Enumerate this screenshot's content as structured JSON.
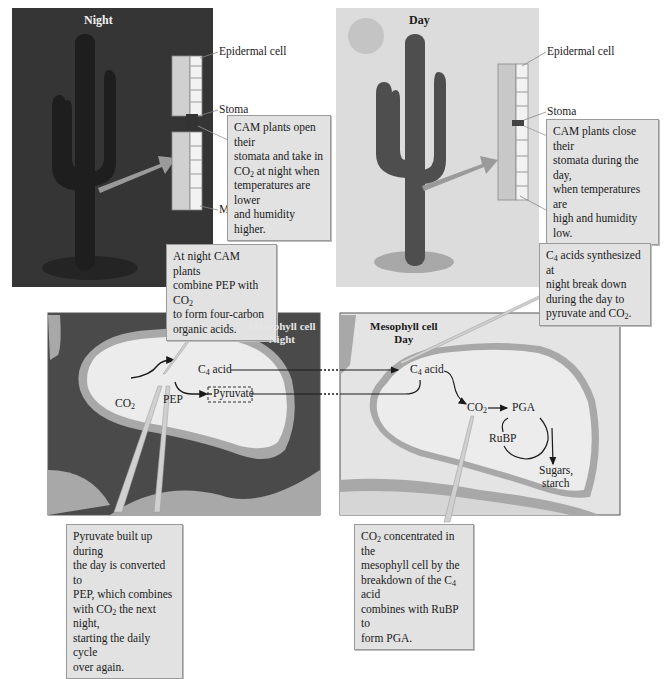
{
  "top_panels": {
    "night": {
      "title": "Night",
      "labels": {
        "epidermal": "Epidermal cell",
        "stoma": "Stoma",
        "mesophyll": "Mesophyll cell"
      },
      "callout": [
        "CAM plants open their",
        "stomata and take in",
        "CO|2| at night when",
        "temperatures are lower",
        "and humidity higher."
      ]
    },
    "day": {
      "title": "Day",
      "labels": {
        "epidermal": "Epidermal cell",
        "stoma": "Stoma",
        "mesophyll": "Mesophyll cell"
      },
      "callout": [
        "CAM plants close their",
        "stomata during the day,",
        "when temperatures are",
        "high and humidity low."
      ]
    }
  },
  "middle_callouts": {
    "night": [
      "At night CAM plants",
      "combine PEP with CO|2|",
      "to form four-carbon",
      "organic acids."
    ],
    "day": [
      "C|4| acids synthesized at",
      "night break down",
      "during the day to",
      "pyruvate and CO|2|."
    ]
  },
  "bottom_panels": {
    "night": {
      "title_line1": "Mesophyll cell",
      "title_line2": "Night",
      "nodes": {
        "co2": "CO|2|",
        "pep": "PEP",
        "c4_acid": "C|4| acid",
        "pyruvate": "Pyruvate"
      }
    },
    "day": {
      "title_line1": "Mesophyll cell",
      "title_line2": "Day",
      "nodes": {
        "c4_acid": "C|4| acid",
        "co2": "CO|2|",
        "pga": "PGA",
        "rubp": "RuBP",
        "sugars": "Sugars,",
        "starch": "starch"
      }
    }
  },
  "bottom_callouts": {
    "night": [
      "Pyruvate built up during",
      "the day is converted to",
      "PEP, which combines",
      "with CO|2| the next night,",
      "starting the daily cycle",
      "over again."
    ],
    "day": [
      "CO|2| concentrated in the",
      "mesophyll cell by the",
      "breakdown of the C|4| acid",
      "combines with RuBP to",
      "form PGA."
    ]
  },
  "colors": {
    "night_sky": "#3a3a3a",
    "day_sky": "#dcdcdc",
    "night_cell_dark": "#4a4a4a",
    "cell_wall": "#a8a8a8",
    "cytoplasm": "#ececec",
    "callout_bg": "#e2e2e2"
  }
}
